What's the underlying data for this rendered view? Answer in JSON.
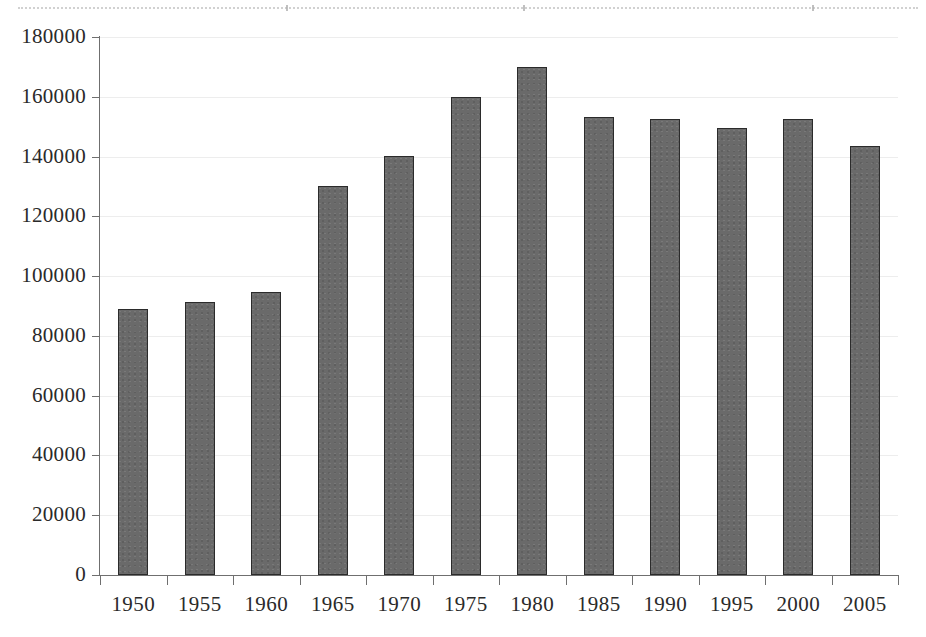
{
  "figure": {
    "background_color": "#ffffff",
    "bar_fill_color": "#6a6a6a",
    "bar_border_color": "#2b2b2b",
    "axis_color": "#6f6f6f",
    "gridline_color": "#ededed",
    "text_color": "#2a2a2a"
  },
  "chart_data": {
    "type": "bar",
    "title": "",
    "subtitle": "",
    "xlabel": "",
    "ylabel": "",
    "categories": [
      "1950",
      "1955",
      "1960",
      "1965",
      "1970",
      "1975",
      "1980",
      "1985",
      "1990",
      "1995",
      "2000",
      "2005"
    ],
    "values": [
      89000,
      91400,
      94700,
      130300,
      140100,
      160000,
      170000,
      153400,
      152600,
      149400,
      152500,
      143400
    ],
    "series": [
      {
        "name": "",
        "values": [
          89000,
          91400,
          94700,
          130300,
          140100,
          160000,
          170000,
          153400,
          152600,
          149400,
          152500,
          143400
        ]
      }
    ],
    "ylim": [
      0,
      180000
    ],
    "xlim": [
      0,
      12
    ],
    "ytick_labels": [
      "0",
      "20000",
      "40000",
      "60000",
      "80000",
      "100000",
      "120000",
      "140000",
      "160000",
      "180000"
    ],
    "ytick_values": [
      0,
      20000,
      40000,
      60000,
      80000,
      100000,
      120000,
      140000,
      160000,
      180000
    ],
    "xtick_labels": [
      "1950",
      "1955",
      "1960",
      "1965",
      "1970",
      "1975",
      "1980",
      "1985",
      "1990",
      "1995",
      "2000",
      "2005"
    ],
    "grid": "horizontal",
    "legend": "none",
    "annotations": []
  }
}
